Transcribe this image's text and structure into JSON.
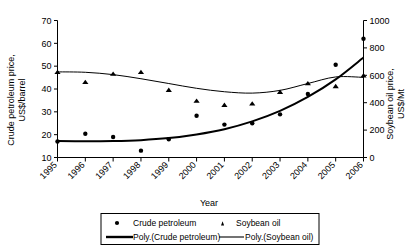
{
  "chart_data": {
    "type": "scatter",
    "title": "",
    "xlabel": "Year",
    "categories": [
      1995,
      1996,
      1997,
      1998,
      1999,
      2000,
      2001,
      2002,
      2003,
      2004,
      2005,
      2006
    ],
    "xlim": [
      1995,
      2006
    ],
    "grid": false,
    "legend_position": "bottom",
    "left_axis": {
      "label_line1": "Crude petroleum price,",
      "label_line2": "US$/barrel",
      "ticks": [
        10,
        20,
        30,
        40,
        50,
        60,
        70
      ],
      "min": 10,
      "max": 70
    },
    "right_axis": {
      "label_line1": "Soybean oil price,",
      "label_line2": "US$/Mt",
      "ticks": [
        0,
        200,
        400,
        600,
        800,
        1000
      ],
      "min": 0,
      "max": 1000
    },
    "series": [
      {
        "name": "Crude petroleum",
        "marker": "circle",
        "axis": "left",
        "unit": "US$/barrel",
        "values": [
          17.0,
          20.4,
          19.0,
          13.0,
          18.0,
          28.3,
          24.4,
          25.0,
          28.9,
          37.8,
          50.6,
          62.0
        ]
      },
      {
        "name": "Soybean oil",
        "marker": "triangle",
        "axis": "right",
        "unit": "US$/Mt",
        "values": [
          625.0,
          552.0,
          612.0,
          625.0,
          495.0,
          415.0,
          385.0,
          395.0,
          480.0,
          543.0,
          522.0,
          600.0
        ]
      }
    ],
    "trendlines": [
      {
        "name": "Poly.(Crude petroleum)",
        "series_ref": "Crude petroleum",
        "axis": "left",
        "fit": "polynomial",
        "values": [
          17.2,
          17.1,
          17.2,
          17.6,
          18.5,
          20.1,
          22.4,
          25.8,
          30.4,
          36.5,
          44.2,
          53.8
        ]
      },
      {
        "name": "Poly.(Soybean oil)",
        "series_ref": "Soybean oil",
        "axis": "right",
        "fit": "polynomial",
        "values": [
          625.0,
          622.0,
          605.0,
          575.0,
          540.0,
          505.0,
          480.0,
          470.0,
          490.0,
          540.0,
          588.0,
          585.0
        ]
      }
    ],
    "tick_labels_x": [
      "1995",
      "1996",
      "1997",
      "1998",
      "1999",
      "2000",
      "2001",
      "2002",
      "2003",
      "2004",
      "2005",
      "2006"
    ],
    "tick_labels_y_left": [
      "10",
      "20",
      "30",
      "40",
      "50",
      "60",
      "70"
    ],
    "tick_labels_y_right": [
      "0",
      "200",
      "400",
      "600",
      "800",
      "1000"
    ],
    "legend": [
      {
        "label": "Crude petroleum",
        "marker": "circle"
      },
      {
        "label": "Soybean oil",
        "marker": "triangle"
      },
      {
        "label": "Poly.(Crude petroleum)",
        "marker": "line-thick"
      },
      {
        "label": "Poly.(Soybean oil)",
        "marker": "line-thin"
      }
    ],
    "colors": {
      "ink": "#000000",
      "background": "#ffffff"
    }
  }
}
